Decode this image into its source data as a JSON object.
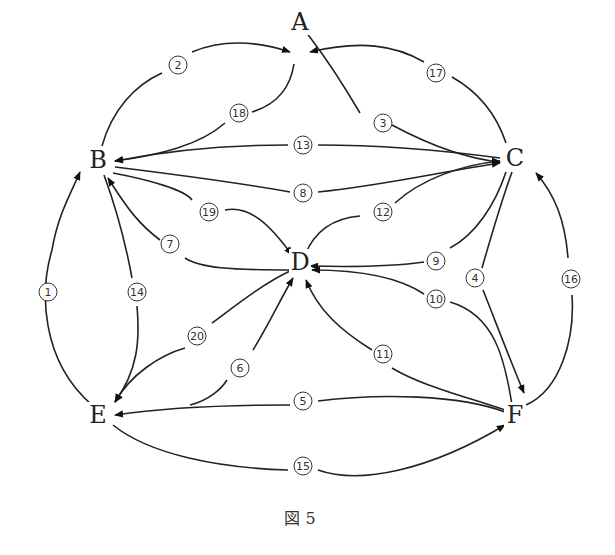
{
  "caption": "図 5",
  "nodes": [
    {
      "id": "A",
      "label": "A",
      "x": 300,
      "y": 22
    },
    {
      "id": "B",
      "label": "B",
      "x": 98,
      "y": 160
    },
    {
      "id": "C",
      "label": "C",
      "x": 515,
      "y": 158
    },
    {
      "id": "D",
      "label": "D",
      "x": 300,
      "y": 262
    },
    {
      "id": "E",
      "label": "E",
      "x": 98,
      "y": 415
    },
    {
      "id": "F",
      "label": "F",
      "x": 515,
      "y": 415
    }
  ],
  "edges": [
    {
      "num": "1",
      "badge": "①",
      "from": "E",
      "to": "B",
      "bx": 48,
      "by": 292
    },
    {
      "num": "2",
      "badge": "②",
      "from": "B",
      "to": "A",
      "bx": 178,
      "by": 65
    },
    {
      "num": "3",
      "badge": "③",
      "from": "A",
      "to": "C",
      "bx": 383,
      "by": 123
    },
    {
      "num": "4",
      "badge": "④",
      "from": "C",
      "to": "F",
      "bx": 475,
      "by": 278
    },
    {
      "num": "5",
      "badge": "⑤",
      "from": "F",
      "to": "E",
      "bx": 303,
      "by": 401
    },
    {
      "num": "6",
      "badge": "⑥",
      "from": "E",
      "to": "D",
      "bx": 240,
      "by": 368
    },
    {
      "num": "7",
      "badge": "⑦",
      "from": "D",
      "to": "B",
      "bx": 170,
      "by": 244
    },
    {
      "num": "8",
      "badge": "⑧",
      "from": "B",
      "to": "C",
      "bx": 303,
      "by": 193
    },
    {
      "num": "9",
      "badge": "⑨",
      "from": "C",
      "to": "D",
      "bx": 436,
      "by": 261
    },
    {
      "num": "10",
      "badge": "⑩",
      "from": "F",
      "to": "D",
      "bx": 436,
      "by": 299
    },
    {
      "num": "11",
      "badge": "⑪",
      "from": "F",
      "to": "D",
      "bx": 383,
      "by": 354
    },
    {
      "num": "12",
      "badge": "⑫",
      "from": "D",
      "to": "C",
      "bx": 383,
      "by": 212
    },
    {
      "num": "13",
      "badge": "⑬",
      "from": "C",
      "to": "B",
      "bx": 303,
      "by": 145
    },
    {
      "num": "14",
      "badge": "⑭",
      "from": "B",
      "to": "E",
      "bx": 137,
      "by": 292
    },
    {
      "num": "15",
      "badge": "⑮",
      "from": "E",
      "to": "F",
      "bx": 303,
      "by": 466
    },
    {
      "num": "16",
      "badge": "⑯",
      "from": "F",
      "to": "C",
      "bx": 571,
      "by": 279
    },
    {
      "num": "17",
      "badge": "⑰",
      "from": "C",
      "to": "A",
      "bx": 436,
      "by": 73
    },
    {
      "num": "18",
      "badge": "⑱",
      "from": "A",
      "to": "B",
      "bx": 239,
      "by": 113
    },
    {
      "num": "19",
      "badge": "⑲",
      "from": "B",
      "to": "D",
      "bx": 209,
      "by": 212
    },
    {
      "num": "20",
      "badge": "⑳",
      "from": "D",
      "to": "E",
      "bx": 197,
      "by": 336
    }
  ]
}
